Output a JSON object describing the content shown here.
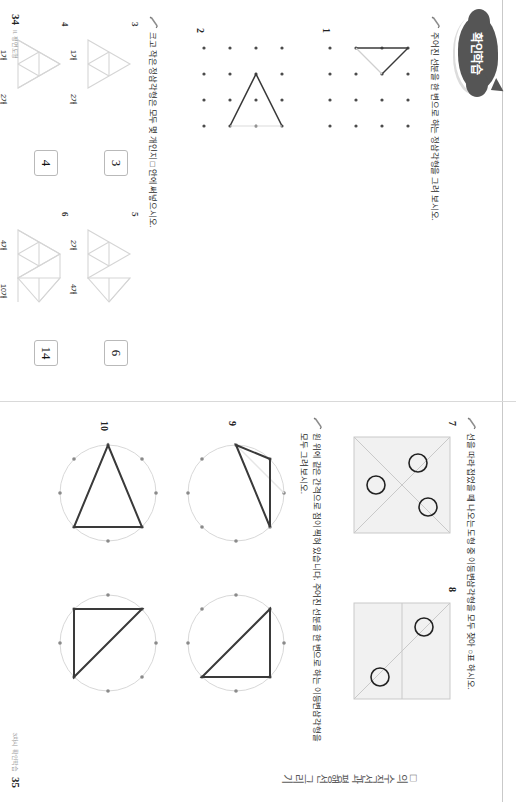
{
  "document": {
    "type": "math-workbook-spread",
    "bubble_label": "확인학습",
    "section_title": "□의 수직선과 평행선 그리기"
  },
  "left_page": {
    "folio": {
      "page_number": "34",
      "label": "II. 평면도형"
    },
    "prompts": [
      {
        "id": "p1",
        "icon": "pencil-icon",
        "text": "주어진 선분을 한 변으로 하는 정삼각형을 그려 보시오."
      },
      {
        "id": "p2",
        "icon": "pencil-icon",
        "text": "크고 작은 정삼각형은 모두 몇 개인지 □ 안에 써넣으시오."
      }
    ],
    "dot_problems": [
      {
        "number": "1"
      },
      {
        "number": "2"
      }
    ],
    "count_problems": [
      {
        "number": "3",
        "unit_labels": [
          "1개",
          "2개"
        ],
        "answer": "3"
      },
      {
        "number": "4",
        "unit_labels": [
          "1개",
          "2개"
        ],
        "answer": "4"
      },
      {
        "number": "5",
        "unit_labels": [
          "2개",
          "4개"
        ],
        "answer": "6"
      },
      {
        "number": "6",
        "unit_labels": [
          "4개",
          "10개"
        ],
        "answer": "14"
      }
    ]
  },
  "right_page": {
    "folio": {
      "page_number": "35",
      "label": "3차시 확인학습"
    },
    "prompts": [
      {
        "id": "p7",
        "icon": "pencil-icon",
        "text": "선을 따라 접었을 때 나오는 도형 중 이등변삼각형을 모두 찾아 ○표 하시오."
      },
      {
        "id": "p9",
        "icon": "pencil-icon",
        "text": "원 위에 같은 간격으로 점이 찍혀 있습니다. 주어진 선분을 한 변으로 하는 이등변삼각형을"
      },
      {
        "id": "p9b",
        "icon": "",
        "text": "모두 그려 보시오."
      }
    ],
    "fold_problems": [
      {
        "number": "7",
        "circle_marks": 3
      },
      {
        "number": "8",
        "circle_marks": 2
      }
    ],
    "circle_problems": [
      {
        "number": "9",
        "dot_count": 8
      },
      {
        "number": "10",
        "dot_count": 8
      }
    ]
  }
}
